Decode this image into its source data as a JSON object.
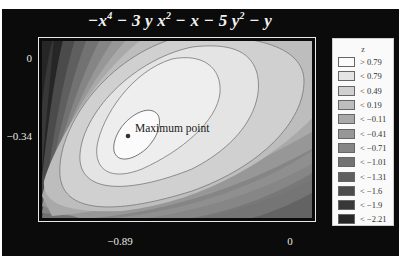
{
  "chart_data": {
    "type": "contour",
    "title_parts": {
      "t1": "−x",
      "e1": "4",
      "t2": " − 3 y x",
      "e2": "2",
      "t3": " − x − 5 y",
      "e3": "2",
      "t4": " − y"
    },
    "function": "-x^4 - 3*y*x^2 - x - 5*y^2 - y",
    "xlabel": "",
    "ylabel": "",
    "x_ticks": [
      "−0.89",
      "0"
    ],
    "y_ticks": [
      "0",
      "−0.34"
    ],
    "annotation": {
      "text": "Maximum point",
      "marker": "dot"
    },
    "legend": {
      "title": "z",
      "position": "right",
      "entries": [
        {
          "label": "> 0.79",
          "color": "#fbfbfb"
        },
        {
          "label": "< 0.79",
          "color": "#e4e4e4"
        },
        {
          "label": "< 0.49",
          "color": "#d0d0d0"
        },
        {
          "label": "< 0.19",
          "color": "#bdbdbd"
        },
        {
          "label": "< −0.11",
          "color": "#a9a9a9"
        },
        {
          "label": "< −0.41",
          "color": "#979797"
        },
        {
          "label": "< −0.71",
          "color": "#858585"
        },
        {
          "label": "< −1.01",
          "color": "#727272"
        },
        {
          "label": "< −1.31",
          "color": "#5f5f5f"
        },
        {
          "label": "< −1.6",
          "color": "#4b4b4b"
        },
        {
          "label": "< −1.9",
          "color": "#383838"
        },
        {
          "label": "< −2.21",
          "color": "#262626"
        }
      ]
    },
    "levels": [
      0.79,
      0.49,
      0.19,
      -0.11,
      -0.41,
      -0.71,
      -1.01,
      -1.31,
      -1.6,
      -1.9,
      -2.21
    ],
    "grid": false,
    "background": "#0b0b0b"
  }
}
